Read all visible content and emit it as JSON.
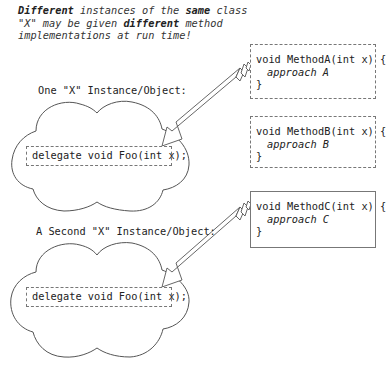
{
  "caption": {
    "parts": [
      {
        "text": "Different",
        "bold": true
      },
      {
        "text": " instances of the ",
        "bold": false
      },
      {
        "text": "same",
        "bold": true
      },
      {
        "text": " class \"X\" may be given ",
        "bold": false
      },
      {
        "text": "different",
        "bold": true
      },
      {
        "text": " method implementations at run time!",
        "bold": false
      }
    ],
    "line1_a": "Different",
    "line1_b": " instances of the ",
    "line1_c": "same",
    "line1_d": " class",
    "line2_a": "\"X\" may be given ",
    "line2_b": "different",
    "line2_c": " method",
    "line3": "implementations at run time!"
  },
  "instances": [
    {
      "label": "One \"X\" Instance/Object:",
      "delegate": "delegate void Foo(int x);"
    },
    {
      "label": "A Second \"X\" Instance/Object:",
      "delegate": "delegate void Foo(int x);"
    }
  ],
  "methods": [
    {
      "signature": "void MethodA(int x) {",
      "body": "approach A",
      "close": "}",
      "border": "dashed-fine"
    },
    {
      "signature": "void MethodB(int x) {",
      "body": "approach B",
      "close": "}",
      "border": "dashed-long"
    },
    {
      "signature": "void MethodC(int x) {",
      "body": "approach C",
      "close": "}",
      "border": "solid"
    }
  ],
  "arrows": [
    {
      "from": "MethodA",
      "to": "instance-1-delegate"
    },
    {
      "from": "MethodC",
      "to": "instance-2-delegate"
    }
  ],
  "colors": {
    "text": "#222222",
    "outline": "#555555",
    "box_border": "#777777",
    "background": "#ffffff"
  }
}
